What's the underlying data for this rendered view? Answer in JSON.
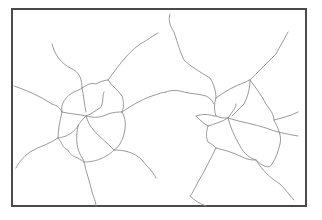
{
  "diagram": {
    "type": "line-network",
    "frame": {
      "x": 11,
      "y": 8,
      "width": 296,
      "height": 199,
      "border_color": "#4a4a4a"
    },
    "line_color": "#8f8f8f",
    "hubs": [
      {
        "name": "left-cluster",
        "cx": 88,
        "cy": 118
      },
      {
        "name": "right-cluster",
        "cx": 222,
        "cy": 118
      }
    ],
    "paths": [
      "M52,44 C56,60 66,66 74,70 C80,74 82,80 82,88",
      "M82,88 C86,86 90,82 96,84 C100,82 104,80 108,80",
      "M108,80 C116,70 124,56 140,44 C148,40 152,36 158,33",
      "M14,86 C26,90 40,96 52,104 C58,106 60,108 62,112",
      "M62,112 C60,104 66,96 74,92 C78,90 80,90 82,88",
      "M82,88 C84,96 84,104 86,112",
      "M108,80 C112,86 118,90 122,96 C124,102 124,108 122,112",
      "M122,112 C134,104 144,98 158,94 C162,92 164,93 166,92",
      "M62,112 C70,114 78,114 86,116",
      "M86,116 C92,114 96,110 100,108 C104,104 102,96 104,92",
      "M86,116 C94,118 100,118 108,114 C114,112 118,112 122,112",
      "M122,112 C126,118 126,126 124,134 C122,142 118,148 114,150",
      "M86,116 C82,120 80,122 78,126",
      "M86,116 C88,122 90,126 92,128 C96,134 104,140 112,148 C114,150 114,150 114,150",
      "M78,126 C74,132 70,134 66,136 C60,138 58,138 58,138",
      "M62,112 C60,120 58,130 58,138",
      "M58,138 C50,144 40,146 30,152 C22,158 18,164 16,168",
      "M58,138 C62,142 62,148 68,150 C70,154 72,156 78,158 C80,160 82,160 84,162",
      "M78,126 C76,136 76,146 80,154 C82,158 84,160 84,162",
      "M84,162 C92,162 100,160 106,156 C110,154 112,152 114,150",
      "M114,150 C124,150 134,152 142,160 C148,168 152,170 156,178",
      "M84,162 C86,172 90,182 92,192 C94,198 96,202 96,206",
      "M170,14 C168,20 170,26 174,32 C178,44 180,52 184,60 C190,66 200,72 210,78 C214,84 216,92 216,98",
      "M166,92 C170,90 178,90 184,92 C192,94 200,94 206,96 C210,98 212,100 214,104",
      "M288,32 C284,40 280,46 276,54 C270,60 264,66 258,72 C254,76 252,78 250,80",
      "M216,98 C224,92 234,86 246,82 C248,80 250,80 250,80",
      "M250,80 C250,88 248,96 244,104 C240,108 236,112 232,116",
      "M250,80 C256,88 262,96 266,104 C270,110 274,114 274,120",
      "M216,98 C214,104 214,110 216,116 C220,118 224,118 228,118",
      "M228,118 C232,112 236,108 236,104",
      "M196,116 C202,114 208,114 214,116 C216,116 216,116 216,116",
      "M196,116 C200,120 204,124 208,126",
      "M228,118 C240,122 254,124 266,128 C276,132 286,134 298,136",
      "M274,120 C278,128 282,136 280,144 C278,152 276,158 272,164",
      "M208,126 C206,132 206,138 208,142 C212,144 214,146 216,148",
      "M228,118 C230,126 234,136 240,146 C244,154 250,158 256,160",
      "M216,148 C224,150 232,152 240,156 C248,160 252,160 256,160",
      "M208,126 C214,124 222,122 228,118",
      "M256,160 C262,166 270,170 272,164",
      "M256,160 C262,170 270,178 280,184 C286,190 290,196 294,200",
      "M216,148 C210,160 204,172 198,182 C194,190 192,194 190,196",
      "M190,196 C194,200 200,204 206,206",
      "M298,112 C290,116 282,118 274,120"
    ]
  }
}
